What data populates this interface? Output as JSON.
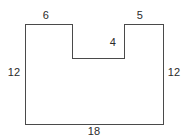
{
  "figure": {
    "kind": "polygon-diagram",
    "background_color": "#ffffff",
    "stroke_color": "#4a4a4a",
    "stroke_width": 1,
    "fill_color": "none",
    "canvas": {
      "width": 191,
      "height": 138
    },
    "vertices": [
      {
        "x": 25,
        "y": 24
      },
      {
        "x": 72,
        "y": 24
      },
      {
        "x": 72,
        "y": 58
      },
      {
        "x": 124,
        "y": 58
      },
      {
        "x": 124,
        "y": 24
      },
      {
        "x": 163,
        "y": 24
      },
      {
        "x": 163,
        "y": 124
      },
      {
        "x": 25,
        "y": 124
      }
    ],
    "labels": [
      {
        "id": "top-left-side",
        "text": "6",
        "x": 46,
        "y": 15,
        "edge": "top-left-horizontal"
      },
      {
        "id": "top-right-side",
        "text": "5",
        "x": 140,
        "y": 15,
        "edge": "top-right-horizontal"
      },
      {
        "id": "notch-right-wall",
        "text": "4",
        "x": 113,
        "y": 42,
        "edge": "notch-right-vertical"
      },
      {
        "id": "left-side",
        "text": "12",
        "x": 14,
        "y": 72,
        "edge": "left-vertical"
      },
      {
        "id": "right-side",
        "text": "12",
        "x": 174,
        "y": 72,
        "edge": "right-vertical"
      },
      {
        "id": "bottom-side",
        "text": "18",
        "x": 94,
        "y": 131,
        "edge": "bottom-horizontal"
      }
    ]
  },
  "chart_data": {
    "type": "diagram",
    "title": "",
    "shape": "rectilinear hexagon with top notch",
    "edge_lengths": {
      "top_left": 6,
      "notch_depth": 4,
      "notch_width": null,
      "top_right": 5,
      "left": 12,
      "right": 12,
      "bottom": 18
    },
    "annotations": [
      "6",
      "5",
      "4",
      "12",
      "12",
      "18"
    ]
  }
}
